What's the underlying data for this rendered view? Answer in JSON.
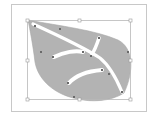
{
  "editor": {
    "view": "vector-path-selection",
    "artboard": {
      "x": 11,
      "y": 4,
      "width": 136,
      "height": 108,
      "border_color": "#c8c8c8"
    },
    "selection_bbox": {
      "x": 27,
      "y": 20,
      "width": 104,
      "height": 80,
      "stroke_color": "#b8b8b8"
    },
    "shape": {
      "name": "leaf",
      "fill_color": "#b3b3b3",
      "vein_color": "#ffffff",
      "anchor_color": "#6a6a6a"
    }
  }
}
